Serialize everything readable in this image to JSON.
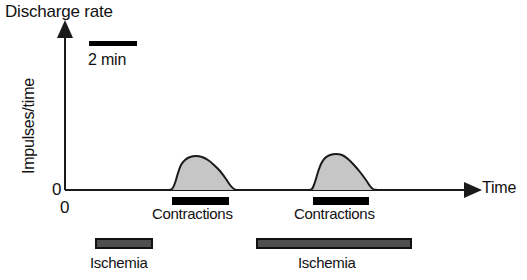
{
  "figure": {
    "title": "Discharge rate",
    "y_axis_label": "Impulses/time",
    "y_zero_label": "0",
    "x_zero_label": "0",
    "x_axis_label": "Time",
    "scalebar_label": "2 min",
    "event_labels": {
      "contractions": "Contractions",
      "ischemia": "Ischemia"
    },
    "colors": {
      "curve_fill": "#c6c6c6",
      "curve_stroke": "#1a1a1a",
      "axis": "#1a1a1a",
      "contraction_bar": "#000000",
      "ischemia_bar": "#4f4f4f",
      "ischemia_bar_border": "#111111",
      "background": "#ffffff",
      "text": "#111111"
    }
  },
  "chart_data": {
    "type": "line",
    "title": "Discharge rate",
    "xlabel": "Time",
    "ylabel": "Impulses/time",
    "grid": false,
    "legend": null,
    "axis": {
      "x_origin_px": 65,
      "x_end_px": 472,
      "y_baseline_px": 190,
      "y_top_px": 30,
      "x_ticks": [
        "0"
      ],
      "y_ticks": [
        "0"
      ],
      "x_arrow": true,
      "y_arrow": true
    },
    "scalebar": {
      "label": "2 min",
      "x_start_px": 89,
      "x_end_px": 137,
      "y_px": 44,
      "duration_min": 2
    },
    "series": [
      {
        "name": "Discharge rate response 1",
        "fill": "#c6c6c6",
        "points": [
          [
            168,
            190
          ],
          [
            172,
            189
          ],
          [
            175,
            183
          ],
          [
            178,
            173
          ],
          [
            181,
            165
          ],
          [
            185,
            160
          ],
          [
            190,
            157
          ],
          [
            196,
            156
          ],
          [
            202,
            157
          ],
          [
            208,
            160
          ],
          [
            214,
            165
          ],
          [
            220,
            171
          ],
          [
            226,
            179
          ],
          [
            230,
            185
          ],
          [
            234,
            189
          ],
          [
            238,
            190
          ]
        ]
      },
      {
        "name": "Discharge rate response 2",
        "fill": "#c6c6c6",
        "points": [
          [
            308,
            190
          ],
          [
            312,
            189
          ],
          [
            315,
            182
          ],
          [
            318,
            172
          ],
          [
            321,
            164
          ],
          [
            325,
            158
          ],
          [
            330,
            155
          ],
          [
            336,
            154
          ],
          [
            342,
            155
          ],
          [
            348,
            159
          ],
          [
            354,
            165
          ],
          [
            360,
            172
          ],
          [
            366,
            180
          ],
          [
            370,
            186
          ],
          [
            373,
            189
          ],
          [
            377,
            190
          ]
        ]
      }
    ],
    "event_bars": [
      {
        "name": "Contractions",
        "kind": "contraction",
        "x_start_px": 172,
        "x_end_px": 229,
        "y_px": 197,
        "height_px": 8,
        "color": "#000000",
        "label": "Contractions"
      },
      {
        "name": "Contractions",
        "kind": "contraction",
        "x_start_px": 313,
        "x_end_px": 369,
        "y_px": 197,
        "height_px": 8,
        "color": "#000000",
        "label": "Contractions"
      },
      {
        "name": "Ischemia",
        "kind": "ischemia",
        "x_start_px": 96,
        "x_end_px": 152,
        "y_px": 239,
        "height_px": 9,
        "color": "#4f4f4f",
        "label": "Ischemia"
      },
      {
        "name": "Ischemia",
        "kind": "ischemia",
        "x_start_px": 257,
        "x_end_px": 411,
        "y_px": 239,
        "height_px": 9,
        "color": "#4f4f4f",
        "label": "Ischemia"
      }
    ]
  }
}
